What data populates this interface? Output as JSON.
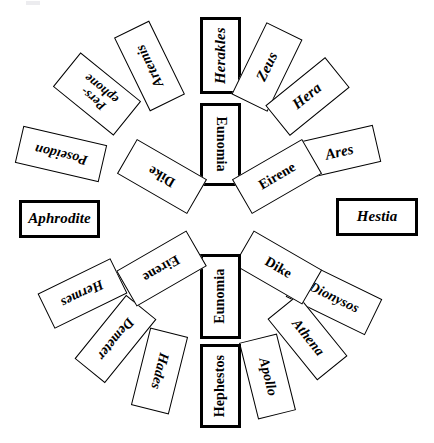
{
  "diagram": {
    "type": "radial-rosette",
    "title_visible": false,
    "palette": {
      "background": "#ffffff",
      "stroke": "#000000",
      "fill": "#ffffff"
    },
    "ring_labels": {
      "outer": "outer-ring",
      "inner": "inner-ring"
    },
    "outer_ring": [
      {
        "id": "herakles",
        "label": "Herakles",
        "angle_deg": 0,
        "emphasis": "thick",
        "style": "italic",
        "x": 200,
        "y": 17,
        "w": 41,
        "h": 77,
        "rot": 0,
        "text_rot": -90,
        "font": 15
      },
      {
        "id": "zeus",
        "label": "Zeus",
        "angle_deg": 26,
        "emphasis": "normal",
        "style": "italic",
        "x": 247,
        "y": 27,
        "w": 40,
        "h": 80,
        "rot": 26,
        "text_rot": -90,
        "font": 15
      },
      {
        "id": "hera",
        "label": "Hera",
        "angle_deg": 51,
        "emphasis": "normal",
        "style": "italic",
        "x": 288,
        "y": 58,
        "w": 39,
        "h": 77,
        "rot": 51,
        "text_rot": -90,
        "font": 15
      },
      {
        "id": "ares",
        "label": "Ares",
        "angle_deg": 77,
        "emphasis": "normal",
        "style": "italic",
        "x": 320,
        "y": 113,
        "w": 38,
        "h": 78,
        "rot": 77,
        "text_rot": -90,
        "font": 15
      },
      {
        "id": "hestia",
        "label": "Hestia",
        "angle_deg": 90,
        "emphasis": "thick",
        "style": "italic",
        "x": 336,
        "y": 198,
        "w": 82,
        "h": 38,
        "rot": 0,
        "text_rot": 0,
        "font": 15
      },
      {
        "id": "dionysos",
        "label": "Dionysos",
        "angle_deg": 116,
        "emphasis": "normal",
        "style": "italic",
        "x": 314,
        "y": 254,
        "w": 40,
        "h": 88,
        "rot": 116,
        "text_rot": -90,
        "font": 14
      },
      {
        "id": "athena",
        "label": "Athena",
        "angle_deg": 141,
        "emphasis": "normal",
        "style": "italic",
        "x": 288,
        "y": 298,
        "w": 39,
        "h": 79,
        "rot": 141,
        "text_rot": -90,
        "font": 14
      },
      {
        "id": "apollo",
        "label": "Apollo",
        "angle_deg": 166,
        "emphasis": "normal",
        "style": "italic",
        "x": 248,
        "y": 337,
        "w": 39,
        "h": 79,
        "rot": 166,
        "text_rot": -90,
        "font": 14
      },
      {
        "id": "hephestos",
        "label": "Hephestos",
        "angle_deg": 180,
        "emphasis": "thick",
        "style": "upright",
        "x": 200,
        "y": 344,
        "w": 41,
        "h": 84,
        "rot": 0,
        "text_rot": -90,
        "font": 14
      },
      {
        "id": "hades",
        "label": "Hades",
        "angle_deg": 206,
        "emphasis": "normal",
        "style": "italic",
        "x": 140,
        "y": 331,
        "w": 39,
        "h": 80,
        "rot": -166,
        "text_rot": -90,
        "font": 14
      },
      {
        "id": "demeter",
        "label": "Demeter",
        "angle_deg": 231,
        "emphasis": "normal",
        "style": "italic",
        "x": 96,
        "y": 298,
        "w": 39,
        "h": 82,
        "rot": -141,
        "text_rot": -90,
        "font": 14
      },
      {
        "id": "hermes",
        "label": "Hermes",
        "angle_deg": 257,
        "emphasis": "normal",
        "style": "italic",
        "x": 63,
        "y": 253,
        "w": 39,
        "h": 81,
        "rot": -116,
        "text_rot": -90,
        "font": 14
      },
      {
        "id": "aphrodite",
        "label": "Aphrodite",
        "angle_deg": 270,
        "emphasis": "thick",
        "style": "italic",
        "x": 19,
        "y": 200,
        "w": 81,
        "h": 38,
        "rot": 0,
        "text_rot": 0,
        "font": 15
      },
      {
        "id": "poseidon",
        "label": "Poseidon",
        "angle_deg": 283,
        "emphasis": "normal",
        "style": "italic",
        "x": 42,
        "y": 111,
        "w": 38,
        "h": 86,
        "rot": -77,
        "text_rot": -90,
        "font": 14
      },
      {
        "id": "persephone",
        "label": "Pers-\nephone",
        "label_line1": "Pers-",
        "label_line2": "ephone",
        "angle_deg": 309,
        "emphasis": "normal",
        "style": "italic",
        "x": 75,
        "y": 55,
        "w": 44,
        "h": 78,
        "rot": -51,
        "text_rot": -90,
        "font": 13
      },
      {
        "id": "artemis",
        "label": "Artemis",
        "angle_deg": 334,
        "emphasis": "normal",
        "style": "italic",
        "x": 130,
        "y": 25,
        "w": 39,
        "h": 82,
        "rot": -26,
        "text_rot": -90,
        "font": 14
      }
    ],
    "inner_ring": [
      {
        "id": "eunomia-top",
        "label": "Eunomia",
        "emphasis": "thick",
        "style": "upright",
        "x": 200,
        "y": 103,
        "w": 41,
        "h": 83,
        "rot": 0,
        "text_rot": 90,
        "font": 14
      },
      {
        "id": "eirene-upper-right",
        "label": "Eirene",
        "emphasis": "normal",
        "style": "upright",
        "x": 257,
        "y": 136,
        "w": 40,
        "h": 81,
        "rot": 60,
        "text_rot": -90,
        "font": 14
      },
      {
        "id": "dike-lower-right",
        "label": "Dike",
        "emphasis": "normal",
        "style": "upright",
        "x": 258,
        "y": 228,
        "w": 40,
        "h": 79,
        "rot": 120,
        "text_rot": -90,
        "font": 14
      },
      {
        "id": "eunomia-bottom",
        "label": "Eunomia",
        "emphasis": "thick",
        "style": "upright",
        "x": 200,
        "y": 254,
        "w": 41,
        "h": 85,
        "rot": 0,
        "text_rot": -90,
        "font": 14
      },
      {
        "id": "eirene-lower-left",
        "label": "Eirene",
        "emphasis": "normal",
        "style": "upright",
        "x": 141,
        "y": 228,
        "w": 41,
        "h": 81,
        "rot": -120,
        "text_rot": -90,
        "font": 14
      },
      {
        "id": "dike-upper-left",
        "label": "Dike",
        "emphasis": "normal",
        "style": "upright",
        "x": 142,
        "y": 136,
        "w": 40,
        "h": 81,
        "rot": -60,
        "text_rot": -90,
        "font": 14
      }
    ]
  }
}
